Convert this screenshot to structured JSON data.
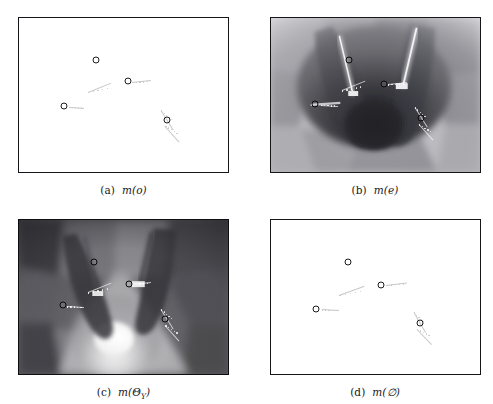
{
  "figure": {
    "type": "multi-panel-image-figure",
    "rows": 2,
    "cols": 2,
    "background": "#ffffff",
    "frame_color": "#15161a"
  },
  "panels": [
    {
      "id": "a",
      "caption_index": "(a)",
      "caption_function": "m",
      "caption_argument": "o",
      "caption_full": "(a) m(o)",
      "image_kind": "white-blank-mass-map",
      "description": "Mass assignment map rendered almost entirely white (near-zero mass) with four annotated circular landmark markers and faint light-gray measurement traces.",
      "markers": [
        {
          "label": "marker-1",
          "x_pct": 37.0,
          "y_pct": 27.5
        },
        {
          "label": "marker-2",
          "x_pct": 52.0,
          "y_pct": 41.0
        },
        {
          "label": "marker-3",
          "x_pct": 21.5,
          "y_pct": 57.0
        },
        {
          "label": "marker-4",
          "x_pct": 71.0,
          "y_pct": 66.5
        }
      ],
      "traces": [
        {
          "x_pct": 33.0,
          "y_pct": 48.0,
          "len_pct": 12.0,
          "angle_deg": -22
        },
        {
          "x_pct": 54.0,
          "y_pct": 41.5,
          "len_pct": 9.0,
          "angle_deg": -6
        },
        {
          "x_pct": 24.0,
          "y_pct": 57.5,
          "len_pct": 7.0,
          "angle_deg": 4
        },
        {
          "x_pct": 68.0,
          "y_pct": 60.0,
          "len_pct": 11.0,
          "angle_deg": 58
        },
        {
          "x_pct": 70.0,
          "y_pct": 70.0,
          "len_pct": 10.0,
          "angle_deg": 48
        }
      ]
    },
    {
      "id": "b",
      "caption_index": "(b)",
      "caption_function": "m",
      "caption_argument": "e",
      "caption_full": "(b) m(e)",
      "image_kind": "grayscale-radial-sector-map",
      "description": "Grayscale polar/fan sensor map: a dark high-mass core at the centre bottom with radial sectors of mid-gray fanning outward, two bright vertical beam streaks, and light gray rims at the outer edges.",
      "tone": {
        "core": "#2b2b2f",
        "mid": "#6f6f74",
        "outer": "#c9c9cd",
        "beam": "#f2f2f2"
      },
      "markers": [
        {
          "label": "marker-1",
          "x_pct": 37.5,
          "y_pct": 27.0
        },
        {
          "label": "marker-2",
          "x_pct": 54.5,
          "y_pct": 43.0
        },
        {
          "label": "marker-3",
          "x_pct": 21.5,
          "y_pct": 56.0
        },
        {
          "label": "marker-4",
          "x_pct": 72.0,
          "y_pct": 65.0
        }
      ],
      "traces": [
        {
          "x_pct": 34.0,
          "y_pct": 47.0,
          "len_pct": 12.0,
          "angle_deg": -22
        },
        {
          "x_pct": 56.0,
          "y_pct": 43.0,
          "len_pct": 9.0,
          "angle_deg": -6
        },
        {
          "x_pct": 24.0,
          "y_pct": 56.5,
          "len_pct": 8.0,
          "angle_deg": 3
        },
        {
          "x_pct": 69.0,
          "y_pct": 58.0,
          "len_pct": 11.0,
          "angle_deg": 58
        },
        {
          "x_pct": 71.0,
          "y_pct": 69.0,
          "len_pct": 10.0,
          "angle_deg": 48
        }
      ]
    },
    {
      "id": "c",
      "caption_index": "(c)",
      "caption_function": "m",
      "caption_argument": "Θ",
      "caption_subscript": "Y",
      "caption_full": "(c) m(ΘY)",
      "image_kind": "grayscale-radial-sector-map-bright-core",
      "description": "Grayscale polar map, inverse of panel (b): a very bright saturated core at the centre bottom, light gray fan sectors spreading upward and dark gray sectors in the corners and outer ring.",
      "tone": {
        "core": "#f6f6f6",
        "mid": "#b9b9bd",
        "outer": "#4a4a4e",
        "beam": "#3a3a3e"
      },
      "markers": [
        {
          "label": "marker-1",
          "x_pct": 36.0,
          "y_pct": 27.0
        },
        {
          "label": "marker-2",
          "x_pct": 52.5,
          "y_pct": 41.5
        },
        {
          "label": "marker-3",
          "x_pct": 21.0,
          "y_pct": 55.5
        },
        {
          "label": "marker-4",
          "x_pct": 70.0,
          "y_pct": 64.5
        }
      ],
      "traces": [
        {
          "x_pct": 33.0,
          "y_pct": 47.0,
          "len_pct": 12.0,
          "angle_deg": -22
        },
        {
          "x_pct": 54.0,
          "y_pct": 41.5,
          "len_pct": 9.0,
          "angle_deg": -6
        },
        {
          "x_pct": 23.0,
          "y_pct": 56.0,
          "len_pct": 8.0,
          "angle_deg": 3
        },
        {
          "x_pct": 68.0,
          "y_pct": 58.0,
          "len_pct": 11.0,
          "angle_deg": 58
        },
        {
          "x_pct": 70.0,
          "y_pct": 68.5,
          "len_pct": 10.0,
          "angle_deg": 48
        }
      ]
    },
    {
      "id": "d",
      "caption_index": "(d)",
      "caption_function": "m",
      "caption_argument": "∅",
      "caption_full": "(d) m(∅)",
      "image_kind": "white-blank-mass-map",
      "description": "Mass assignment map for the empty set rendered almost entirely white with four annotated circular landmark markers and faint gray conflict traces.",
      "markers": [
        {
          "label": "marker-1",
          "x_pct": 37.0,
          "y_pct": 27.5
        },
        {
          "label": "marker-2",
          "x_pct": 53.0,
          "y_pct": 42.0
        },
        {
          "label": "marker-3",
          "x_pct": 22.0,
          "y_pct": 57.5
        },
        {
          "label": "marker-4",
          "x_pct": 71.5,
          "y_pct": 67.0
        }
      ],
      "traces": [
        {
          "x_pct": 33.0,
          "y_pct": 48.5,
          "len_pct": 13.0,
          "angle_deg": -20
        },
        {
          "x_pct": 55.5,
          "y_pct": 42.0,
          "len_pct": 10.0,
          "angle_deg": -7
        },
        {
          "x_pct": 24.5,
          "y_pct": 58.0,
          "len_pct": 8.0,
          "angle_deg": 3
        },
        {
          "x_pct": 68.5,
          "y_pct": 60.0,
          "len_pct": 11.0,
          "angle_deg": 60
        },
        {
          "x_pct": 70.0,
          "y_pct": 70.5,
          "len_pct": 10.0,
          "angle_deg": 46
        }
      ]
    }
  ]
}
